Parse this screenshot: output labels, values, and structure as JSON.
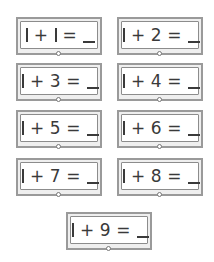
{
  "cards": [
    {
      "a": "1",
      "op": "+",
      "b": "1",
      "eq": "=",
      "answer": "_",
      "text": "1 + 1 = _"
    },
    {
      "a": "1",
      "op": "+",
      "b": "2",
      "eq": "=",
      "answer": "_",
      "text": "1 + 2 = _"
    },
    {
      "a": "1",
      "op": "+",
      "b": "3",
      "eq": "=",
      "answer": "_",
      "text": "1 + 3 = _"
    },
    {
      "a": "1",
      "op": "+",
      "b": "4",
      "eq": "=",
      "answer": "_",
      "text": "1 + 4 = _"
    },
    {
      "a": "1",
      "op": "+",
      "b": "5",
      "eq": "=",
      "answer": "_",
      "text": "1 + 5 = _"
    },
    {
      "a": "1",
      "op": "+",
      "b": "6",
      "eq": "=",
      "answer": "_",
      "text": "1 + 6 = _"
    },
    {
      "a": "1",
      "op": "+",
      "b": "7",
      "eq": "=",
      "answer": "_",
      "text": "1 + 7 = _"
    },
    {
      "a": "1",
      "op": "+",
      "b": "8",
      "eq": "=",
      "answer": "_",
      "text": "1 + 8 = _"
    },
    {
      "a": "1",
      "op": "+",
      "b": "9",
      "eq": "=",
      "answer": "_",
      "text": "1 + 9 = _"
    }
  ],
  "colors": {
    "outer_border": "#9a9a9a",
    "inner_border": "#8c8c8c",
    "text": "#3a3a3a",
    "background": "#ffffff"
  }
}
